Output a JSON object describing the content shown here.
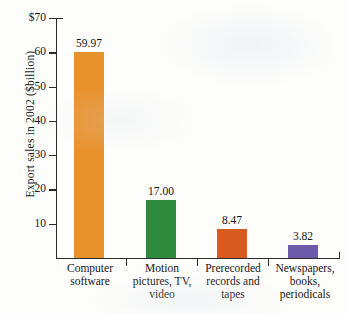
{
  "chart_data": {
    "type": "bar",
    "title": "",
    "subtitle": "",
    "xlabel": "",
    "ylabel": "Export sales in 2002 ($billion)",
    "categories": [
      "Computer software",
      "Motion pictures, TV, video",
      "Prerecorded records and tapes",
      "Newspapers, books, periodicals"
    ],
    "category_lines": [
      [
        "Computer",
        "software"
      ],
      [
        "Motion",
        "pictures, TV,",
        "video"
      ],
      [
        "Prerecorded",
        "records and",
        "tapes"
      ],
      [
        "Newspapers,",
        "books,",
        "periodicals"
      ]
    ],
    "values": [
      59.97,
      17.0,
      8.47,
      3.82
    ],
    "value_labels": [
      "59.97",
      "17.00",
      "8.47",
      "3.82"
    ],
    "bar_colors": [
      "#e8922e",
      "#2e8b3c",
      "#d95a1e",
      "#6b5ba8"
    ],
    "ylim": [
      0,
      70
    ],
    "ytick_values": [
      70,
      60,
      50,
      40,
      30,
      20,
      10
    ],
    "ytick_labels": [
      "$70",
      "60",
      "50",
      "40",
      "30",
      "20",
      "10"
    ],
    "grid": false,
    "legend": false,
    "axis_color": "#2b2b2b"
  }
}
